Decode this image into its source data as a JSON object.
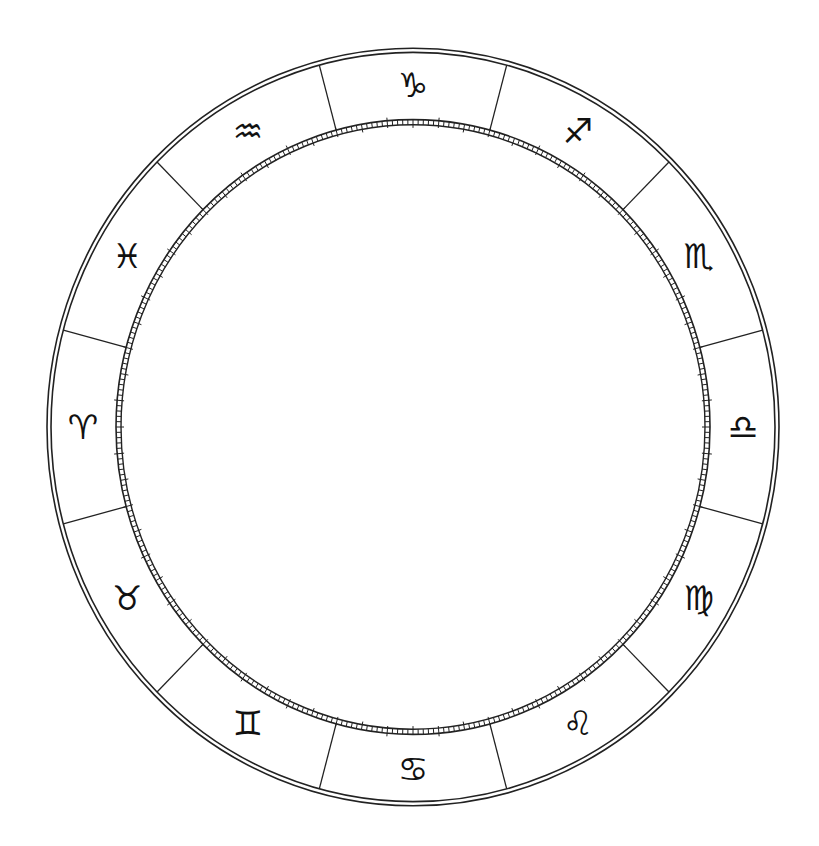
{
  "diagram": {
    "center": {
      "x": 413,
      "y": 427
    },
    "scale_y": 1.035,
    "outer_ring": {
      "r_outer": 366,
      "r_inner": 362
    },
    "tick_band": {
      "r_outer": 297,
      "r_inner": 292,
      "minor_len": 5,
      "mid_len": 8,
      "major_nub": 3
    },
    "divider_offset_deg": 15,
    "line_color": "#222222",
    "glyph_radius": 330,
    "signs": [
      {
        "name": "Aries",
        "glyph": "♈",
        "angle_deg": 180
      },
      {
        "name": "Taurus",
        "glyph": "♉",
        "angle_deg": 210
      },
      {
        "name": "Gemini",
        "glyph": "♊",
        "angle_deg": 240
      },
      {
        "name": "Cancer",
        "glyph": "♋",
        "angle_deg": 270
      },
      {
        "name": "Leo",
        "glyph": "♌",
        "angle_deg": 300
      },
      {
        "name": "Virgo",
        "glyph": "♍",
        "angle_deg": 330
      },
      {
        "name": "Libra",
        "glyph": "♎",
        "angle_deg": 0
      },
      {
        "name": "Scorpio",
        "glyph": "♏",
        "angle_deg": 30
      },
      {
        "name": "Sagittarius",
        "glyph": "♐",
        "angle_deg": 60
      },
      {
        "name": "Capricorn",
        "glyph": "♑",
        "angle_deg": 90
      },
      {
        "name": "Aquarius",
        "glyph": "♒",
        "angle_deg": 120
      },
      {
        "name": "Pisces",
        "glyph": "♓",
        "angle_deg": 150
      }
    ]
  }
}
